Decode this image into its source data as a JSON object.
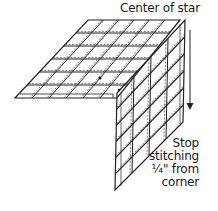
{
  "labels": {
    "center": "Center of star",
    "note_lines": [
      "Stop",
      "stitching",
      "¼\" from",
      "corner"
    ]
  },
  "diagram": {
    "type": "quilt-piecing-illustration",
    "left_panel": {
      "rows": 6,
      "cols": 6
    },
    "right_panel": {
      "rows": 6,
      "cols": 4
    },
    "arrow_direction": "down",
    "stroke_color": "#222222",
    "background": "#ffffff"
  }
}
